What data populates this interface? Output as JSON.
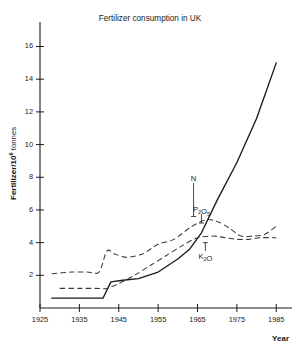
{
  "chart_data": {
    "type": "line",
    "title": "Fertilizer consumption in UK",
    "xlabel": "Year",
    "ylabel": "Fertilizer/10⁶ tonnes",
    "ylabel_base": "Fertilizer/10",
    "ylabel_exponent": "6",
    "ylabel_unit": " tonnes",
    "xlim": [
      1925,
      1989
    ],
    "ylim": [
      0,
      17.5
    ],
    "xticks": [
      1925,
      1935,
      1945,
      1955,
      1965,
      1975,
      1985
    ],
    "xtick_labels": [
      "1925",
      "1935",
      "1945",
      "1955",
      "1965",
      "1975",
      "1985"
    ],
    "yticks": [
      2,
      4,
      6,
      8,
      10,
      12,
      14,
      16
    ],
    "ytick_labels": [
      "2",
      "4",
      "6",
      "8",
      "10",
      "12",
      "14",
      "16"
    ],
    "grid": false,
    "legend_position": "inline-annotations",
    "series": [
      {
        "name": "N",
        "label": "N",
        "label_base": "N",
        "style": "solid",
        "color": "#1a1a1a",
        "x": [
          1928,
          1934,
          1938,
          1941,
          1943,
          1946,
          1950,
          1955,
          1960,
          1963,
          1966,
          1970,
          1975,
          1980,
          1985
        ],
        "values": [
          0.6,
          0.6,
          0.6,
          0.6,
          1.6,
          1.7,
          1.8,
          2.2,
          3.0,
          3.6,
          4.6,
          6.6,
          8.9,
          11.6,
          15.0
        ]
      },
      {
        "name": "P2O5",
        "label": "P₂O₅",
        "label_base": "P",
        "label_sub1": "2",
        "label_mid": "O",
        "label_sub2": "5",
        "style": "dashed",
        "color": "#3a3a3a",
        "x": [
          1928,
          1933,
          1937,
          1940,
          1942,
          1944,
          1947,
          1951,
          1955,
          1959,
          1963,
          1967,
          1970,
          1973,
          1976,
          1979,
          1982,
          1985
        ],
        "values": [
          2.1,
          2.2,
          2.2,
          2.2,
          3.5,
          3.3,
          3.1,
          3.3,
          3.9,
          4.2,
          4.9,
          5.4,
          5.3,
          4.9,
          4.4,
          4.4,
          4.5,
          5.0
        ]
      },
      {
        "name": "K2O",
        "label": "K₂O",
        "label_base": "K",
        "label_sub1": "2",
        "label_mid": "O",
        "style": "dashed",
        "color": "#3a3a3a",
        "x": [
          1930,
          1935,
          1939,
          1942,
          1945,
          1949,
          1953,
          1957,
          1961,
          1965,
          1969,
          1972,
          1975,
          1978,
          1981,
          1985
        ],
        "values": [
          1.2,
          1.2,
          1.2,
          1.2,
          1.5,
          2.0,
          2.6,
          3.2,
          3.8,
          4.3,
          4.4,
          4.3,
          4.2,
          4.2,
          4.3,
          4.3
        ]
      }
    ],
    "annotations": [
      {
        "name": "N",
        "text": "N",
        "x": 1964,
        "y": 7.8,
        "leader_to_y": 5.6
      },
      {
        "name": "P2O5",
        "text": "P₂O₅",
        "x": 1966,
        "y": 5.9,
        "leader_to_y": 5.2
      },
      {
        "name": "K2O",
        "text": "K₂O",
        "x": 1967,
        "y": 3.0,
        "leader_to_y": 4.0
      }
    ]
  }
}
